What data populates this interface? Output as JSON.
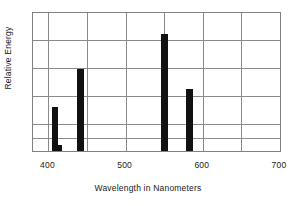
{
  "chart_data": {
    "type": "bar",
    "title": "",
    "xlabel": "Wavelength in Nanometers",
    "ylabel": "Relative Energy",
    "xlim": [
      380,
      700
    ],
    "ylim": [
      0,
      6
    ],
    "xticks": [
      400,
      500,
      600,
      700
    ],
    "xtick_labels": [
      "400",
      "500",
      "600",
      "700"
    ],
    "yticks": [
      0,
      1,
      2,
      3,
      4,
      5,
      6
    ],
    "ytick_labels": [
      "",
      "",
      "",
      "",
      "",
      "",
      ""
    ],
    "grid": true,
    "legend": false,
    "bar_color": "#111111",
    "x": [
      405,
      411,
      437,
      546,
      578
    ],
    "values": [
      1.9,
      0.25,
      3.55,
      5.1,
      2.7
    ],
    "bars": [
      {
        "wavelength": 405,
        "relative_energy": 1.9,
        "label": "405 nm"
      },
      {
        "wavelength": 411,
        "relative_energy": 0.25,
        "label": "411 nm"
      },
      {
        "wavelength": 437,
        "relative_energy": 3.55,
        "label": "437 nm"
      },
      {
        "wavelength": 546,
        "relative_energy": 5.1,
        "label": "546 nm"
      },
      {
        "wavelength": 578,
        "relative_energy": 2.7,
        "label": "578 nm"
      }
    ]
  },
  "axes": {
    "x_title": "Wavelength in Nanometers",
    "y_title": "Relative Energy",
    "x_tick_400": "400",
    "x_tick_500": "500",
    "x_tick_600": "600",
    "x_tick_700": "700"
  },
  "colors": {
    "bar": "#111111",
    "grid": "#8a8a8a",
    "frame": "#808080",
    "text": "#1a1a1a",
    "background": "#ffffff"
  }
}
